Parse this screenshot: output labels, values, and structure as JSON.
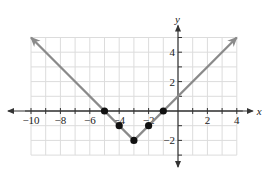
{
  "chart_data": {
    "type": "line",
    "title": "",
    "xlabel": "x",
    "ylabel": "y",
    "xlim": [
      -10,
      4
    ],
    "ylim": [
      -3,
      5
    ],
    "grid": true,
    "x_ticks": [
      -10,
      -8,
      -6,
      -4,
      -2,
      2,
      4
    ],
    "y_ticks": [
      -2,
      2,
      4
    ],
    "x_tick_labels": [
      "−10",
      "−8",
      "−6",
      "−4",
      "−2",
      "2",
      "4"
    ],
    "y_tick_labels": [
      "−2",
      "2",
      "4"
    ],
    "series": [
      {
        "name": "y = |x + 3| - 2",
        "line": {
          "x": [
            -10,
            -3,
            4
          ],
          "y": [
            5,
            -2,
            5
          ]
        },
        "points": {
          "x": [
            -5,
            -4,
            -3,
            -2,
            -1
          ],
          "y": [
            0,
            -1,
            -2,
            -1,
            0
          ]
        },
        "arrows_at_ends": true
      }
    ],
    "colors": {
      "line": "#8a8a8a",
      "points": "#111111",
      "grid": "#dcdcdc",
      "axes": "#333333"
    }
  }
}
